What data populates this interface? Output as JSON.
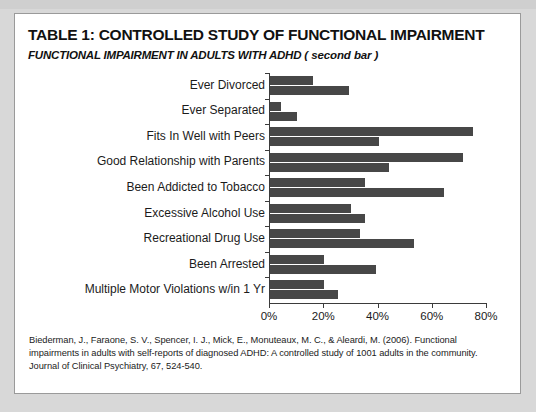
{
  "card": {
    "title": "TABLE 1: CONTROLLED STUDY OF FUNCTIONAL IMPAIRMENT",
    "subtitle": "FUNCTIONAL IMPAIRMENT IN ADULTS WITH ADHD",
    "subtitle_note": "( second bar )",
    "citation": "Biederman, J., Faraone, S. V., Spencer, I. J., Mick, E., Monuteaux, M. C., & Aleardi, M. (2006). Functional impairments in adults with self-reports of diagnosed ADHD: A controlled study of 1001 adults in the community. Journal of Clinical Psychiatry, 67, 524-540."
  },
  "colors": {
    "bar": "#474747",
    "axis": "#3b3b3b",
    "card_border": "#9a9a9a",
    "background": "#d8d8d8"
  },
  "chart_data": {
    "type": "bar",
    "orientation": "horizontal",
    "xlabel": "",
    "ylabel": "",
    "xlim": [
      0,
      80
    ],
    "grid": false,
    "legend": false,
    "xticks": [
      0,
      20,
      40,
      60,
      80
    ],
    "xtick_labels": [
      "0%",
      "20%",
      "40%",
      "60%",
      "80%"
    ],
    "categories": [
      "Ever Divorced",
      "Ever Separated",
      "Fits In Well with Peers",
      "Good Relationship with Parents",
      "Been Addicted to Tobacco",
      "Excessive Alcohol Use",
      "Recreational Drug Use",
      "Been Arrested",
      "Multiple Motor Violations w/in 1 Yr"
    ],
    "series": [
      {
        "name": "Control",
        "values": [
          16,
          4,
          75,
          71,
          35,
          30,
          33,
          20,
          20
        ]
      },
      {
        "name": "ADHD",
        "values": [
          29,
          10,
          40,
          44,
          64,
          35,
          53,
          39,
          25
        ]
      }
    ]
  }
}
